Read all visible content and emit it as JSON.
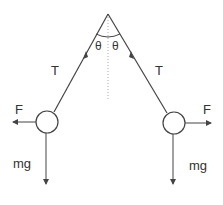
{
  "diagram": {
    "colors": {
      "line": "#444444",
      "text": "#333333",
      "dotted": "#aaaaaa",
      "background": "#ffffff"
    },
    "labels": {
      "tension_left": "T",
      "tension_right": "T",
      "angle_left": "θ",
      "angle_right": "θ",
      "force_left": "F",
      "force_right": "F",
      "weight_left": "mg",
      "weight_right": "mg"
    },
    "geometry": {
      "apex": [
        108,
        14
      ],
      "bob_left": [
        47,
        122
      ],
      "bob_right": [
        174,
        123
      ],
      "bob_radius": 11
    }
  }
}
